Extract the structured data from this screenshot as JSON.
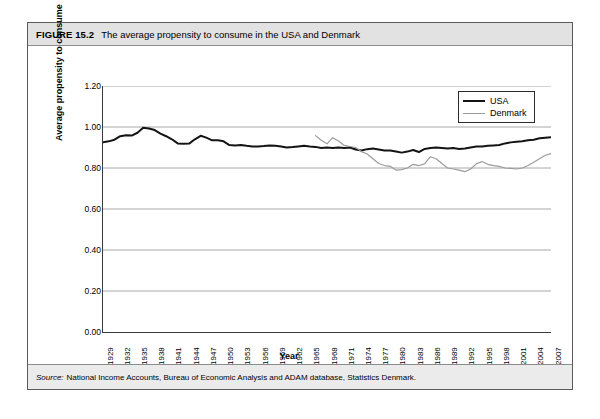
{
  "figure": {
    "label": "FIGURE 15.2",
    "title": "The average propensity to consume in the USA and Denmark",
    "source_word": "Source:",
    "source_text": "National Income Accounts, Bureau of Economic Analysis and ADAM database, Statistics Denmark."
  },
  "colors": {
    "usa_line": "#141414",
    "denmark_line": "#9b9b9b",
    "gridline": "#a8a8a8",
    "axis": "#3a3a3a",
    "title_band": "#e2e2e2",
    "source_band": "#ebebeb",
    "frame": "#5a5a5a"
  },
  "chart_data": {
    "type": "line",
    "title": "The average propensity to consume in the USA and Denmark",
    "xlabel": "Year",
    "ylabel": "Average propensity to consume",
    "xlim": [
      1929,
      2007
    ],
    "ylim": [
      0.0,
      1.2
    ],
    "ytick_step": 0.2,
    "yticks": [
      "0.00",
      "0.20",
      "0.40",
      "0.60",
      "0.80",
      "1.00",
      "1.20"
    ],
    "ytick_values": [
      0.0,
      0.2,
      0.4,
      0.6,
      0.8,
      1.0,
      1.2
    ],
    "xticks": [
      1929,
      1932,
      1935,
      1938,
      1941,
      1944,
      1947,
      1950,
      1953,
      1956,
      1959,
      1962,
      1965,
      1968,
      1971,
      1974,
      1977,
      1980,
      1983,
      1986,
      1989,
      1992,
      1995,
      1998,
      2001,
      2004,
      2007
    ],
    "grid": "horizontal",
    "legend_position": "top-right",
    "series": [
      {
        "name": "USA",
        "color": "#141414",
        "x": [
          1929,
          1930,
          1931,
          1932,
          1933,
          1934,
          1935,
          1936,
          1937,
          1938,
          1939,
          1940,
          1941,
          1942,
          1943,
          1944,
          1945,
          1946,
          1947,
          1948,
          1949,
          1950,
          1951,
          1952,
          1953,
          1954,
          1955,
          1956,
          1957,
          1958,
          1959,
          1960,
          1961,
          1962,
          1963,
          1964,
          1965,
          1966,
          1967,
          1968,
          1969,
          1970,
          1971,
          1972,
          1973,
          1974,
          1975,
          1976,
          1977,
          1978,
          1979,
          1980,
          1981,
          1982,
          1983,
          1984,
          1985,
          1986,
          1987,
          1988,
          1989,
          1990,
          1991,
          1992,
          1993,
          1994,
          1995,
          1996,
          1997,
          1998,
          1999,
          2000,
          2001,
          2002,
          2003,
          2004,
          2005,
          2006,
          2007
        ],
        "values": [
          0.925,
          0.93,
          0.938,
          0.955,
          0.96,
          0.958,
          0.972,
          0.996,
          0.993,
          0.985,
          0.968,
          0.955,
          0.94,
          0.92,
          0.918,
          0.919,
          0.94,
          0.957,
          0.948,
          0.935,
          0.935,
          0.93,
          0.912,
          0.91,
          0.912,
          0.908,
          0.905,
          0.905,
          0.907,
          0.91,
          0.908,
          0.905,
          0.9,
          0.902,
          0.905,
          0.908,
          0.905,
          0.903,
          0.898,
          0.9,
          0.898,
          0.9,
          0.898,
          0.9,
          0.89,
          0.885,
          0.892,
          0.895,
          0.89,
          0.885,
          0.885,
          0.88,
          0.875,
          0.88,
          0.888,
          0.878,
          0.893,
          0.897,
          0.9,
          0.898,
          0.895,
          0.898,
          0.893,
          0.895,
          0.9,
          0.905,
          0.905,
          0.908,
          0.91,
          0.912,
          0.92,
          0.925,
          0.928,
          0.93,
          0.935,
          0.938,
          0.945,
          0.948,
          0.95
        ]
      },
      {
        "name": "Denmark",
        "color": "#9b9b9b",
        "x": [
          1966,
          1967,
          1968,
          1969,
          1970,
          1971,
          1972,
          1973,
          1974,
          1975,
          1976,
          1977,
          1978,
          1979,
          1980,
          1981,
          1982,
          1983,
          1984,
          1985,
          1986,
          1987,
          1988,
          1989,
          1990,
          1991,
          1992,
          1993,
          1994,
          1995,
          1996,
          1997,
          1998,
          1999,
          2000,
          2001,
          2002,
          2003,
          2004,
          2005,
          2006,
          2007
        ],
        "values": [
          0.958,
          0.935,
          0.918,
          0.948,
          0.932,
          0.91,
          0.905,
          0.9,
          0.88,
          0.868,
          0.845,
          0.822,
          0.812,
          0.808,
          0.79,
          0.792,
          0.8,
          0.818,
          0.812,
          0.82,
          0.855,
          0.845,
          0.822,
          0.8,
          0.795,
          0.79,
          0.782,
          0.795,
          0.82,
          0.832,
          0.818,
          0.812,
          0.808,
          0.8,
          0.798,
          0.795,
          0.8,
          0.812,
          0.828,
          0.845,
          0.862,
          0.87
        ]
      }
    ]
  },
  "legend": {
    "items": [
      {
        "label": "USA"
      },
      {
        "label": "Denmark"
      }
    ]
  }
}
